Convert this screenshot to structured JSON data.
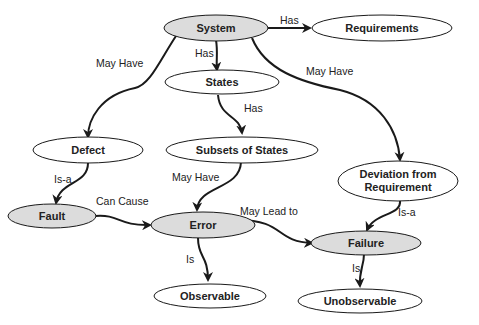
{
  "diagram": {
    "type": "concept-map",
    "colors": {
      "shaded_fill": "#dcdcdc",
      "plain_fill": "#ffffff",
      "stroke": "#1a1a1a"
    },
    "nodes": {
      "system": {
        "label": "System",
        "shaded": true
      },
      "requirements": {
        "label": "Requirements",
        "shaded": false
      },
      "states": {
        "label": "States",
        "shaded": false
      },
      "defect": {
        "label": "Defect",
        "shaded": false
      },
      "subsets": {
        "label": "Subsets of States",
        "shaded": false
      },
      "deviation": {
        "label_line1": "Deviation from",
        "label_line2": "Requirement",
        "shaded": false
      },
      "fault": {
        "label": "Fault",
        "shaded": true
      },
      "error": {
        "label": "Error",
        "shaded": true
      },
      "failure": {
        "label": "Failure",
        "shaded": true
      },
      "observable": {
        "label": "Observable",
        "shaded": false
      },
      "unobservable": {
        "label": "Unobservable",
        "shaded": false
      }
    },
    "edges": {
      "system_requirements": {
        "from": "System",
        "to": "Requirements",
        "label": "Has"
      },
      "system_states": {
        "from": "System",
        "to": "States",
        "label": "Has"
      },
      "system_defect": {
        "from": "System",
        "to": "Defect",
        "label": "May Have"
      },
      "system_deviation": {
        "from": "System",
        "to": "Deviation from Requirement",
        "label": "May Have"
      },
      "states_subsets": {
        "from": "States",
        "to": "Subsets of States",
        "label": "Has"
      },
      "defect_fault": {
        "from": "Defect",
        "to": "Fault",
        "label": "Is-a"
      },
      "subsets_error": {
        "from": "Subsets of States",
        "to": "Error",
        "label": "May Have"
      },
      "fault_error": {
        "from": "Fault",
        "to": "Error",
        "label": "Can Cause"
      },
      "error_failure": {
        "from": "Error",
        "to": "Failure",
        "label": "May Lead to"
      },
      "deviation_failure": {
        "from": "Deviation from Requirement",
        "to": "Failure",
        "label": "Is-a"
      },
      "error_observable": {
        "from": "Error",
        "to": "Observable",
        "label": "Is"
      },
      "failure_unobservable": {
        "from": "Failure",
        "to": "Unobservable",
        "label": "Is"
      }
    }
  }
}
